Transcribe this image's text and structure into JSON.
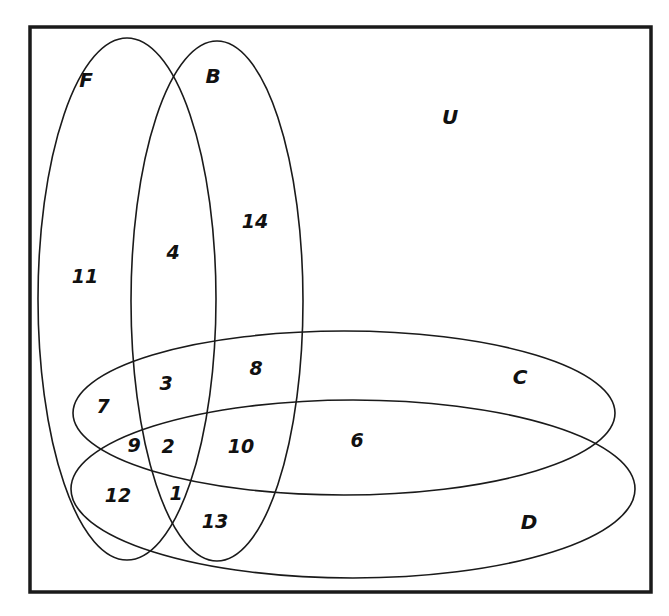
{
  "diagram": {
    "type": "venn",
    "universe_label": "U",
    "colors": {
      "stroke": "#1a1a1a",
      "background": "#ffffff",
      "text": "#111111"
    },
    "sets": [
      {
        "label": "F",
        "label_x": 86,
        "label_y": 80
      },
      {
        "label": "B",
        "label_x": 213,
        "label_y": 76
      },
      {
        "label": "C",
        "label_x": 520,
        "label_y": 377
      },
      {
        "label": "D",
        "label_x": 529,
        "label_y": 522
      }
    ],
    "regions": [
      {
        "value": "11",
        "x": 85,
        "y": 276
      },
      {
        "value": "4",
        "x": 173,
        "y": 252
      },
      {
        "value": "14",
        "x": 255,
        "y": 221
      },
      {
        "value": "3",
        "x": 166,
        "y": 383
      },
      {
        "value": "8",
        "x": 256,
        "y": 368
      },
      {
        "value": "7",
        "x": 103,
        "y": 406
      },
      {
        "value": "9",
        "x": 134,
        "y": 445
      },
      {
        "value": "2",
        "x": 168,
        "y": 446
      },
      {
        "value": "10",
        "x": 241,
        "y": 446
      },
      {
        "value": "6",
        "x": 357,
        "y": 440
      },
      {
        "value": "12",
        "x": 118,
        "y": 495
      },
      {
        "value": "1",
        "x": 176,
        "y": 493
      },
      {
        "value": "13",
        "x": 215,
        "y": 521
      }
    ]
  }
}
